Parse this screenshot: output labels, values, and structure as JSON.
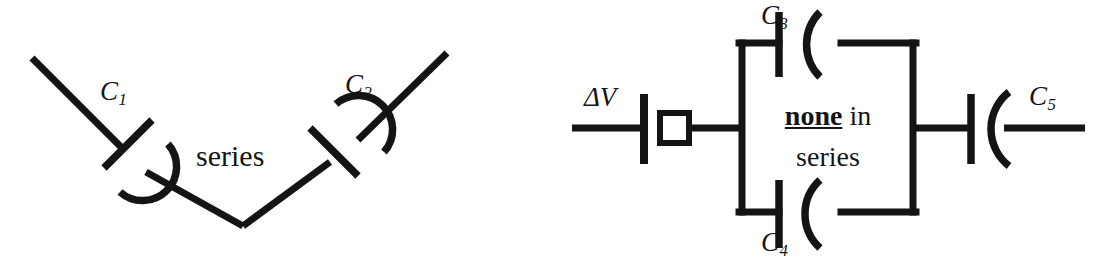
{
  "figure": {
    "ink_color": "#141414",
    "background_color": "#ffffff"
  },
  "left_circuit": {
    "name": "v-shaped-series-pair",
    "verdict_text": "series",
    "capacitors": [
      {
        "id": "C1",
        "label_base": "C",
        "label_sub": "1",
        "orientation": "diagonal-descending"
      },
      {
        "id": "C2",
        "label_base": "C",
        "label_sub": "2",
        "orientation": "diagonal-ascending"
      }
    ]
  },
  "right_circuit": {
    "name": "parallel-branch-with-battery",
    "source": {
      "id": "dV",
      "label_base": "ΔV",
      "type": "battery"
    },
    "verdict_line1_bold": "none",
    "verdict_line1_rest": " in",
    "verdict_line2": "series",
    "capacitors": [
      {
        "id": "C3",
        "label_base": "C",
        "label_sub": "3",
        "branch": "top"
      },
      {
        "id": "C4",
        "label_base": "C",
        "label_sub": "4",
        "branch": "bottom"
      },
      {
        "id": "C5",
        "label_base": "C",
        "label_sub": "5",
        "branch": "right-series"
      }
    ]
  }
}
